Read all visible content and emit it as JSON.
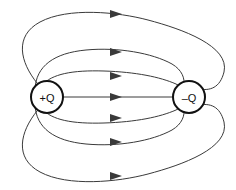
{
  "figure": {
    "width": 236,
    "height": 190,
    "background_color": "#ffffff",
    "line_color": "#3a3a3a",
    "charge_outline_color": "#111111",
    "charge_fill_color": "#ffffff"
  },
  "charges": [
    {
      "id": "positive-charge",
      "label": "+Q",
      "sign": "positive",
      "cx": 47,
      "cy": 97,
      "r": 16
    },
    {
      "id": "negative-charge",
      "label": "–Q",
      "sign": "negative",
      "cx": 189,
      "cy": 97,
      "r": 16
    }
  ],
  "field_lines": [
    {
      "id": "line-outer-top",
      "description": "outermost upper loop",
      "arrow_x": 117,
      "arrow_y": 14,
      "arrow_direction": "right"
    },
    {
      "id": "line-mid-top",
      "description": "middle upper arc",
      "arrow_x": 117,
      "arrow_y": 52,
      "arrow_direction": "right"
    },
    {
      "id": "line-inner-top",
      "description": "inner upper arc",
      "arrow_x": 117,
      "arrow_y": 76,
      "arrow_direction": "right"
    },
    {
      "id": "line-axis",
      "description": "straight axial line between charges",
      "arrow_x": 117,
      "arrow_y": 97,
      "arrow_direction": "right"
    },
    {
      "id": "line-inner-bottom",
      "description": "inner lower arc",
      "arrow_x": 117,
      "arrow_y": 118,
      "arrow_direction": "right"
    },
    {
      "id": "line-mid-bottom",
      "description": "middle lower arc",
      "arrow_x": 117,
      "arrow_y": 142,
      "arrow_direction": "right"
    },
    {
      "id": "line-outer-bottom",
      "description": "outermost lower loop",
      "arrow_x": 117,
      "arrow_y": 176,
      "arrow_direction": "right"
    }
  ],
  "counts": {
    "field_lines": 7,
    "arrowheads": 7,
    "charges": 2
  }
}
